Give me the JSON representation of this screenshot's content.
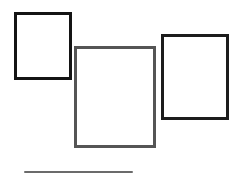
{
  "canvas": {
    "width": 240,
    "height": 177,
    "background": "#ffffff"
  },
  "shapes": [
    {
      "id": "rect-left",
      "type": "rectangle",
      "x": 14,
      "y": 12,
      "width": 58,
      "height": 68,
      "border": 3,
      "color": "#141414"
    },
    {
      "id": "rect-center",
      "type": "rectangle",
      "x": 74,
      "y": 46,
      "width": 82,
      "height": 102,
      "border": 3,
      "color": "#555555"
    },
    {
      "id": "rect-right",
      "type": "rectangle",
      "x": 161,
      "y": 34,
      "width": 68,
      "height": 86,
      "border": 3,
      "color": "#1c1c1c"
    },
    {
      "id": "line-bottom",
      "type": "line",
      "x": 24,
      "y": 171,
      "width": 109,
      "height": 2,
      "color": "#6b6b6b"
    }
  ]
}
